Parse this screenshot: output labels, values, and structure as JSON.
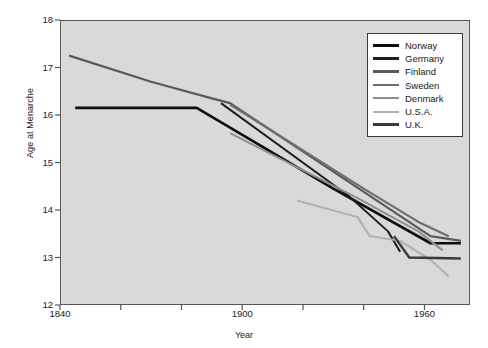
{
  "chart_data": {
    "type": "line",
    "title": "",
    "xlabel": "Year",
    "ylabel": "Age at Menarche",
    "xlim": [
      1840,
      1975
    ],
    "ylim": [
      12,
      18
    ],
    "xticks_major": [
      1840,
      1900,
      1960
    ],
    "xticks_minor": [
      1860,
      1880,
      1920,
      1940
    ],
    "yticks": [
      12,
      13,
      14,
      15,
      16,
      17,
      18
    ],
    "grid": false,
    "legend_position": "top-right",
    "series": [
      {
        "name": "Norway",
        "color": "#0d0d0d",
        "width": 2.6,
        "points": [
          [
            1845,
            16.15
          ],
          [
            1885,
            16.15
          ],
          [
            1930,
            14.45
          ],
          [
            1962,
            13.3
          ],
          [
            1972,
            13.3
          ]
        ]
      },
      {
        "name": "Germany",
        "color": "#1f1f1f",
        "width": 2.0,
        "points": [
          [
            1893,
            16.25
          ],
          [
            1935,
            14.3
          ],
          [
            1948,
            13.55
          ],
          [
            1952,
            13.12
          ]
        ]
      },
      {
        "name": "Finland",
        "color": "#5a5a5a",
        "width": 2.2,
        "points": [
          [
            1843,
            17.25
          ],
          [
            1870,
            16.7
          ],
          [
            1890,
            16.35
          ],
          [
            1896,
            16.25
          ],
          [
            1962,
            13.45
          ],
          [
            1972,
            13.35
          ]
        ]
      },
      {
        "name": "Sweden",
        "color": "#6e6e6e",
        "width": 2.2,
        "points": [
          [
            1896,
            16.22
          ],
          [
            1940,
            14.45
          ],
          [
            1958,
            13.75
          ],
          [
            1968,
            13.45
          ]
        ]
      },
      {
        "name": "Denmark",
        "color": "#8f8f8f",
        "width": 2.0,
        "points": [
          [
            1896,
            15.62
          ],
          [
            1938,
            14.25
          ],
          [
            1958,
            13.55
          ],
          [
            1966,
            13.15
          ]
        ]
      },
      {
        "name": "U.S.A.",
        "color": "#b0b0b0",
        "width": 2.0,
        "points": [
          [
            1918,
            14.2
          ],
          [
            1938,
            13.85
          ],
          [
            1942,
            13.45
          ],
          [
            1952,
            13.35
          ],
          [
            1962,
            12.95
          ],
          [
            1968,
            12.6
          ]
        ]
      },
      {
        "name": "U.K.",
        "color": "#3a3a3a",
        "width": 2.4,
        "points": [
          [
            1950,
            13.45
          ],
          [
            1955,
            13.0
          ],
          [
            1972,
            12.98
          ]
        ]
      }
    ]
  },
  "axes": {
    "y_label": "Age at Menarche",
    "x_label": "Year",
    "y_ticks": [
      "18",
      "17",
      "16",
      "15",
      "14",
      "13",
      "12"
    ],
    "x_ticks": [
      "1840",
      "1900",
      "1960"
    ]
  },
  "legend": {
    "items": [
      {
        "label": "Norway",
        "color": "#0d0d0d",
        "width": 3.4
      },
      {
        "label": "Germany",
        "color": "#1f1f1f",
        "width": 3.0
      },
      {
        "label": "Finland",
        "color": "#5a5a5a",
        "width": 3.0
      },
      {
        "label": "Sweden",
        "color": "#6e6e6e",
        "width": 2.8
      },
      {
        "label": "Denmark",
        "color": "#8f8f8f",
        "width": 2.6
      },
      {
        "label": "U.S.A.",
        "color": "#b0b0b0",
        "width": 2.4
      },
      {
        "label": "U.K.",
        "color": "#3a3a3a",
        "width": 3.2
      }
    ]
  },
  "colors": {
    "plot_background": "#d9d9d9",
    "page_background": "#ffffff",
    "frame": "#555555",
    "text": "#222222"
  }
}
